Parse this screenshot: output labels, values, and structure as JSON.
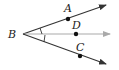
{
  "diagram": {
    "type": "angle-bisector",
    "vertex": {
      "label": "B",
      "x": 23,
      "y": 34
    },
    "rays": [
      {
        "name": "ray-BA",
        "end": {
          "x": 106,
          "y": 5
        },
        "color": "#333333"
      },
      {
        "name": "ray-BD",
        "end": {
          "x": 110,
          "y": 34
        },
        "color": "#aaaaaa"
      },
      {
        "name": "ray-BC",
        "end": {
          "x": 106,
          "y": 64
        },
        "color": "#333333"
      }
    ],
    "points": [
      {
        "label": "A",
        "x": 68,
        "y": 18,
        "label_x": 64,
        "label_y": 12
      },
      {
        "label": "D",
        "x": 76,
        "y": 34,
        "label_x": 72,
        "label_y": 28
      },
      {
        "label": "C",
        "x": 80,
        "y": 56,
        "label_x": 76,
        "label_y": 50
      }
    ],
    "angle_marks": 2
  }
}
